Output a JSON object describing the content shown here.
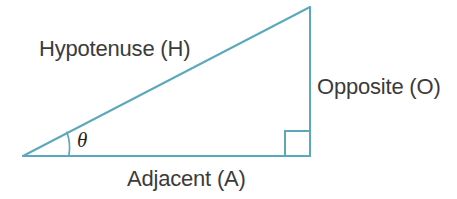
{
  "diagram": {
    "kind": "right-triangle-trigonometry",
    "background_color": "#ffffff",
    "stroke_color": "#5ba8bc",
    "text_color": "#3b3b3b",
    "angle_symbol_color": "#1f1f1f",
    "stroke_width": 2,
    "labels": {
      "hypotenuse": "Hypotenuse (H)",
      "opposite": "Opposite (O)",
      "adjacent": "Adjacent (A)",
      "angle": "θ"
    },
    "geometry": {
      "left_vertex": [
        23,
        156
      ],
      "right_angle_vertex": [
        310,
        156
      ],
      "apex_vertex": [
        310,
        7
      ],
      "right_angle_marker": {
        "x": 285,
        "y": 131,
        "size": 25
      },
      "angle_arc": {
        "center": [
          23,
          156
        ],
        "radius": 46,
        "start": [
          69,
          155
        ],
        "end": [
          67,
          132
        ]
      }
    }
  }
}
